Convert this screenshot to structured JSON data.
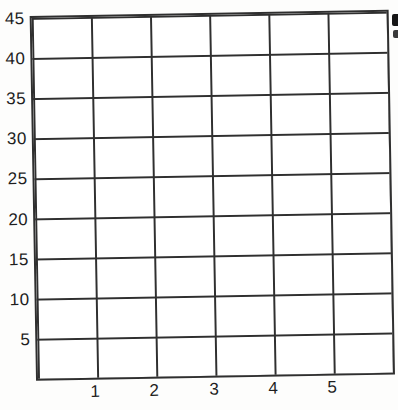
{
  "figure": {
    "background": "#ffffff",
    "line_color": "#2f2f2f",
    "text_color": "#1e1e1e"
  },
  "chart_data": {
    "type": "line",
    "title": "",
    "xlabel": "",
    "ylabel": "",
    "series": [],
    "xlim": [
      0,
      6
    ],
    "ylim": [
      0,
      45
    ],
    "xticks": [
      "1",
      "2",
      "3",
      "4",
      "5"
    ],
    "yticks": [
      "45",
      "40",
      "35",
      "30",
      "25",
      "20",
      "15",
      "10",
      "5"
    ],
    "grid": "on",
    "legend": "none",
    "columns": 6,
    "rows": 9,
    "note": "blank graph grid with no plotted data"
  },
  "artifacts": {
    "right_edge_fragments": "two small clipped ink marks from adjacent page content, text unreadable"
  }
}
